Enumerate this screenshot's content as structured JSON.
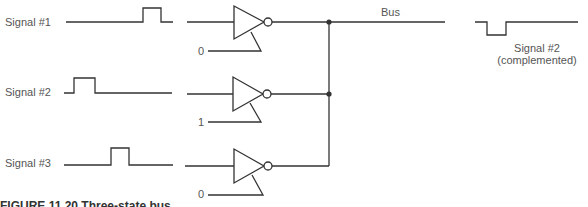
{
  "signals": [
    {
      "label": "Signal #1"
    },
    {
      "label": "Signal #2"
    },
    {
      "label": "Signal #3"
    }
  ],
  "gates": [
    {
      "control": "0"
    },
    {
      "control": "1"
    },
    {
      "control": "0"
    }
  ],
  "bus": {
    "label": "Bus"
  },
  "output": {
    "label_line1": "Signal #2",
    "label_line2": "(complemented)"
  },
  "caption": "FIGURE 11.20  Three-state bus"
}
